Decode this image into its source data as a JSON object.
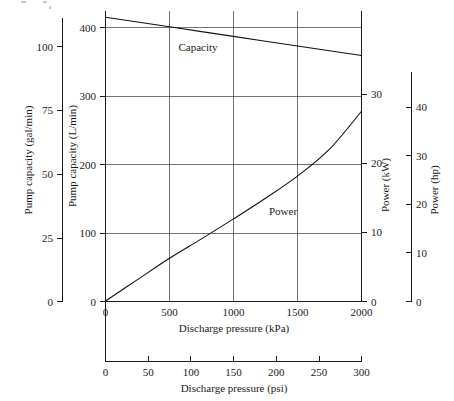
{
  "figure": {
    "background_color": "#ffffff",
    "ink_color": "#1a1a1a",
    "grid_color": "#3a3a3a"
  },
  "axes": {
    "left_outer": {
      "title": "Pump capacity (gal/min)",
      "unit": "gal/min",
      "ticks": [
        "0",
        "25",
        "50",
        "75",
        "100"
      ],
      "tick_values": [
        0,
        25,
        50,
        75,
        100
      ],
      "range": [
        0,
        110
      ]
    },
    "left_inner": {
      "title": "Pump capacity (L/min)",
      "unit": "L/min",
      "ticks": [
        "0",
        "100",
        "200",
        "300",
        "400"
      ],
      "tick_values": [
        0,
        100,
        200,
        300,
        400
      ],
      "range": [
        0,
        425
      ]
    },
    "right_inner": {
      "title": "Power (kW)",
      "unit": "kW",
      "ticks": [
        "0",
        "10",
        "20",
        "30"
      ],
      "tick_values": [
        0,
        10,
        20,
        30
      ],
      "range": [
        0,
        30
      ]
    },
    "right_outer": {
      "title": "Power (hp)",
      "unit": "hp",
      "ticks": [
        "0",
        "10",
        "20",
        "30",
        "40"
      ],
      "tick_values": [
        0,
        10,
        20,
        30,
        40
      ],
      "range": [
        0,
        42
      ]
    },
    "bottom_inner": {
      "title": "Discharge pressure (kPa)",
      "unit": "kPa",
      "ticks": [
        "0",
        "500",
        "1000",
        "1500",
        "2000"
      ],
      "tick_values": [
        0,
        500,
        1000,
        1500,
        2000
      ],
      "range": [
        0,
        2000
      ]
    },
    "bottom_outer": {
      "title": "Discharge pressure (psi)",
      "unit": "psi",
      "ticks": [
        "0",
        "50",
        "100",
        "150",
        "200",
        "250",
        "300"
      ],
      "tick_values": [
        0,
        50,
        100,
        150,
        200,
        250,
        300
      ],
      "range": [
        0,
        300
      ]
    }
  },
  "labels": {
    "capacity": "Capacity",
    "power": "Power"
  },
  "chart_data": {
    "type": "line",
    "title": "",
    "subtitle": "",
    "xlabel": "Discharge pressure (kPa)",
    "ylabel": "Pump capacity (L/min)",
    "y2label": "Power (kW)",
    "xlim": [
      0,
      2000
    ],
    "ylim": [
      0,
      425
    ],
    "y2lim": [
      0,
      30
    ],
    "grid": true,
    "legend": "inline-curve-labels",
    "secondary_xaxis": {
      "label": "Discharge pressure (psi)",
      "lim": [
        0,
        300
      ],
      "ticks": [
        0,
        50,
        100,
        150,
        200,
        250,
        300
      ]
    },
    "secondary_yaxis": {
      "label": "Power (hp)",
      "lim": [
        0,
        42
      ],
      "ticks": [
        0,
        10,
        20,
        30,
        40
      ]
    },
    "series": [
      {
        "name": "Capacity",
        "axis": "left",
        "unit": "L/min",
        "x": [
          0,
          250,
          500,
          750,
          1000,
          1250,
          1500,
          1750,
          2000
        ],
        "values": [
          415,
          408,
          401,
          394,
          387,
          380,
          373,
          366,
          359
        ]
      },
      {
        "name": "Power",
        "axis": "right",
        "unit": "kW",
        "x": [
          0,
          250,
          500,
          750,
          1000,
          1250,
          1500,
          1750,
          2000
        ],
        "values": [
          0,
          3.1,
          6.2,
          9.0,
          11.9,
          14.9,
          18.1,
          22.0,
          27.5
        ]
      }
    ]
  }
}
